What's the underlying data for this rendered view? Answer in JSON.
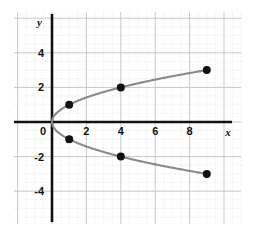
{
  "chart_data": {
    "type": "scatter",
    "title": "",
    "subtitle": "",
    "xlabel": "x",
    "ylabel": "y",
    "xlim": [
      -1.2,
      11.2
    ],
    "ylim": [
      -5.0,
      5.6
    ],
    "grid": true,
    "minor_grid": true,
    "legend": "none",
    "xticks": [
      0,
      2,
      4,
      6,
      8
    ],
    "xtick_labels": [
      "0",
      "2",
      "4",
      "6",
      "8"
    ],
    "yticks": [
      4,
      2,
      0,
      -2,
      -4
    ],
    "ytick_labels": [
      "4",
      "2",
      "0",
      "-2",
      "-4"
    ],
    "series": [
      {
        "name": "upper-branch",
        "type": "line",
        "equation": "x = y^2, y >= 0",
        "color": "#8a8a8a",
        "x": [
          0,
          0.25,
          1,
          2.25,
          4,
          6.25,
          9
        ],
        "y": [
          0,
          0.5,
          1,
          1.5,
          2,
          2.5,
          3
        ]
      },
      {
        "name": "lower-branch",
        "type": "line",
        "equation": "x = y^2, y <= 0",
        "color": "#8a8a8a",
        "x": [
          0,
          0.25,
          1,
          2.25,
          4,
          6.25,
          9
        ],
        "y": [
          0,
          -0.5,
          -1,
          -1.5,
          -2,
          -2.5,
          -3
        ]
      },
      {
        "name": "marked-points",
        "type": "scatter",
        "color": "#111111",
        "points": [
          {
            "x": 1,
            "y": 1
          },
          {
            "x": 4,
            "y": 2
          },
          {
            "x": 9,
            "y": 3
          },
          {
            "x": 1,
            "y": -1
          },
          {
            "x": 4,
            "y": -2
          },
          {
            "x": 9,
            "y": -3
          }
        ]
      }
    ],
    "colors": {
      "background": "#ffffff",
      "axis": "#111111",
      "curve": "#8a8a8a",
      "point": "#111111",
      "major_grid": "#c9c9c9",
      "minor_grid": "#dedede"
    }
  },
  "axis_labels": {
    "x": "x",
    "y": "y"
  }
}
